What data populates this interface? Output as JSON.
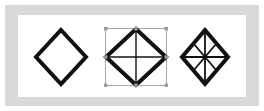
{
  "image": {
    "width": 264,
    "height": 111,
    "kind": "geometry-diagram",
    "background_color": "#ffffff",
    "frame_color": "#d9d9d9",
    "canvas_color": "#ffffff",
    "stroke_color": "#111111",
    "handle_color": "#9a9a9a",
    "guide_color": "#a8a8a8"
  },
  "figures": [
    {
      "id": "plain-diamond",
      "label": "Diamond outline",
      "shape": "rhombus",
      "stroke_width": 4,
      "center": {
        "x": 61,
        "y": 57
      },
      "half_width": 25,
      "half_height": 27,
      "interior_lines": [],
      "selected": false,
      "handles": []
    },
    {
      "id": "diamond-with-cross-selected",
      "label": "Diamond with cross, selected",
      "shape": "rhombus",
      "stroke_width": 4,
      "center": {
        "x": 136,
        "y": 57
      },
      "half_width": 31,
      "half_height": 29,
      "interior_lines": [
        "horizontal",
        "vertical"
      ],
      "interior_stroke_width": 1.4,
      "selected": true,
      "bounding_box": {
        "x": 105,
        "y": 28,
        "width": 62,
        "height": 58
      },
      "handles": [
        "top-left",
        "top-center",
        "top-right",
        "middle-left",
        "middle-right",
        "bottom-left",
        "bottom-center",
        "bottom-right"
      ],
      "handle_size": 3
    },
    {
      "id": "diamond-eight-spokes",
      "label": "Diamond with eight spokes",
      "shape": "rhombus",
      "stroke_width": 4,
      "center": {
        "x": 205,
        "y": 57
      },
      "half_width": 23,
      "half_height": 27,
      "interior_lines": [
        "horizontal",
        "vertical",
        "diagonal-up",
        "diagonal-down"
      ],
      "interior_stroke_width": 1.8,
      "selected": false,
      "handles": []
    }
  ]
}
